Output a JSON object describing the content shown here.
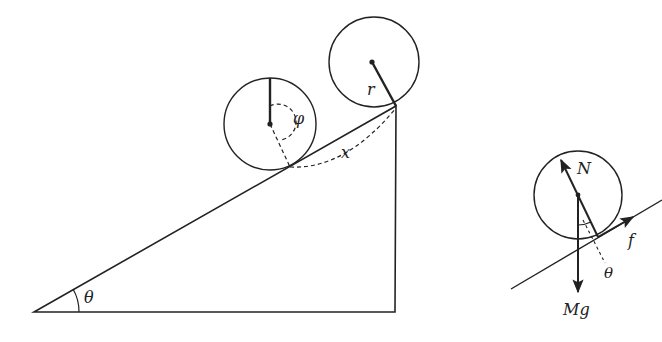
{
  "colors": {
    "ink": "#222222",
    "background": "#ffffff"
  },
  "incline_diagram": {
    "labels": {
      "angle": "θ",
      "rotation_angle": "φ",
      "displacement": "x",
      "radius": "r"
    },
    "triangle": {
      "bottom_left": [
        34,
        312
      ],
      "bottom_right": [
        395,
        312
      ],
      "top": [
        396,
        106
      ]
    },
    "rolling_cylinder": {
      "center": [
        270,
        124
      ],
      "radius": 46
    },
    "top_cylinder": {
      "center": [
        372,
        62
      ],
      "radius": 45
    }
  },
  "free_body_diagram": {
    "labels": {
      "normal_force": "N",
      "friction": "f",
      "weight": "Mg",
      "angle": "θ"
    },
    "cylinder": {
      "center": [
        578,
        195
      ],
      "radius": 44
    },
    "incline": {
      "from": [
        511,
        289
      ],
      "to": [
        662,
        200
      ]
    }
  }
}
